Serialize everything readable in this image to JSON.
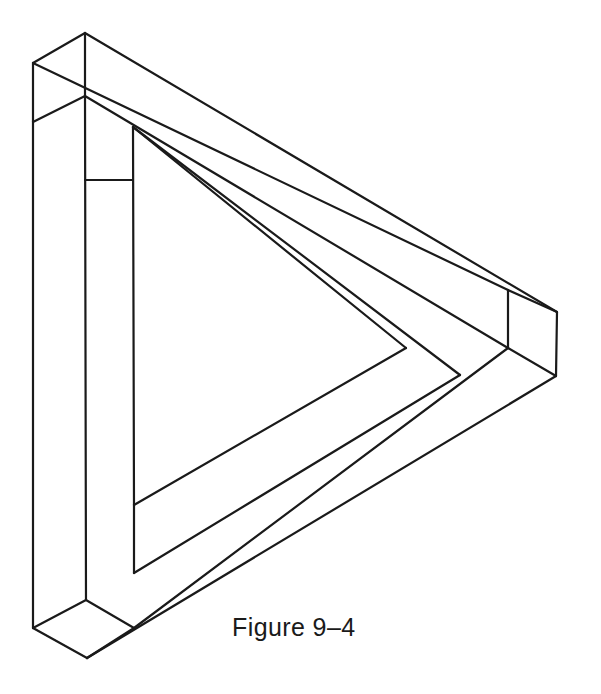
{
  "figure": {
    "caption": "Figure 9–4",
    "background_color": "#ffffff",
    "line_color": "#1a1a1a",
    "face_color": "#ffffff",
    "stroke_width": 2.2,
    "canvas": {
      "width": 601,
      "height": 694
    },
    "shape_type": "penrose-tribar",
    "geometry": {
      "outer_outline": "85,33 557,312 557,377 87,658 40,628 40,63",
      "bar_top_outer": "85,33 557,312 510,290 33,63",
      "bar_top_inner": "85,96 508,348 460,375 133,127",
      "bar_left_outer": "33,63 33,628 85,600 85,33",
      "bar_left_inner": "87,658 87,600 135,573 135,127",
      "bar_right_outer": "557,312 557,377 87,658 40,628",
      "bar_right_inner": "508,348 460,375 135,505 135,573",
      "inner_triangle": "133,127 135,505 406,348",
      "vertices": [
        {
          "name": "top-apex-outer",
          "x": 85,
          "y": 33
        },
        {
          "name": "top-apex-inner",
          "x": 85,
          "y": 96
        },
        {
          "name": "top-left-outer",
          "x": 33,
          "y": 63
        },
        {
          "name": "left-bend",
          "x": 34,
          "y": 122
        },
        {
          "name": "inner-vertical-top",
          "x": 133,
          "y": 127
        },
        {
          "name": "inner-vertical-mid",
          "x": 133,
          "y": 180
        },
        {
          "name": "inner-vertical-bottom",
          "x": 135,
          "y": 505
        },
        {
          "name": "right-vertical-top",
          "x": 508,
          "y": 290
        },
        {
          "name": "right-corner-junction",
          "x": 508,
          "y": 348
        },
        {
          "name": "right-extreme-top",
          "x": 557,
          "y": 312
        },
        {
          "name": "right-extreme-bottom",
          "x": 556,
          "y": 376
        },
        {
          "name": "inner-triangle-apex",
          "x": 406,
          "y": 348
        },
        {
          "name": "inner-right-junction",
          "x": 460,
          "y": 375
        },
        {
          "name": "bottom-left-outer",
          "x": 40,
          "y": 628
        },
        {
          "name": "bottom-junction",
          "x": 86,
          "y": 600
        },
        {
          "name": "bottom-vertex",
          "x": 87,
          "y": 658
        },
        {
          "name": "bottom-right-of-foot",
          "x": 134,
          "y": 628
        }
      ]
    }
  }
}
